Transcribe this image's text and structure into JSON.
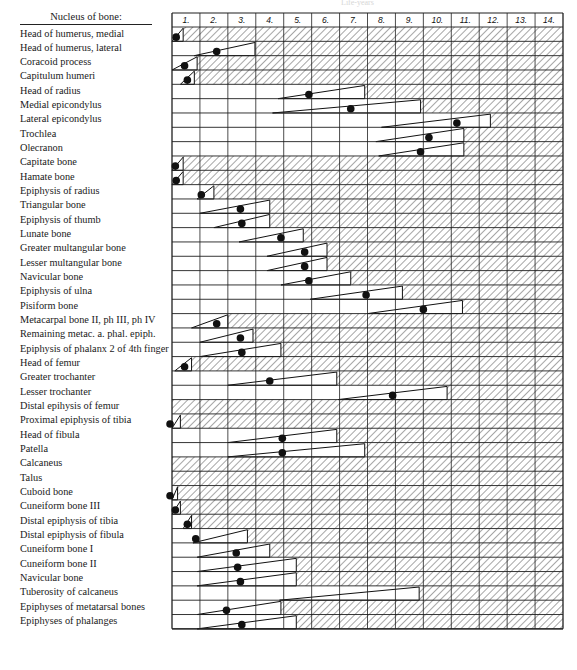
{
  "header": {
    "label_column_title": "Nucleus of bone:",
    "faint_top_text": "Life-years"
  },
  "grid": {
    "x0": 172,
    "x1": 563,
    "header_top": 13,
    "header_bottom": 27,
    "row_top": 27,
    "row_height": 14.33,
    "line_color": "#1f1f1f",
    "hatch_color": "#333333",
    "dot_color": "#111111"
  },
  "chart_data": {
    "type": "table",
    "xlabel": "Age (years)",
    "columns": [
      "1.",
      "2.",
      "3.",
      "4.",
      "5.",
      "6.",
      "7.",
      "8.",
      "9.",
      "10.",
      "11.",
      "12.",
      "13.",
      "14."
    ],
    "legend": {
      "wedge": "range of appearance (open triangle)",
      "dot": "typical/mean age of appearance",
      "hatch": "nucleus present"
    },
    "rows": [
      {
        "name": "Head of humerus, medial",
        "start": 0.0,
        "end": 0.4,
        "dot": 0.15
      },
      {
        "name": "Head of humerus, lateral",
        "start": 0.8,
        "end": 2.97,
        "dot": 1.6
      },
      {
        "name": "Coracoid process",
        "start": 0.0,
        "end": 0.9,
        "dot": 0.45
      },
      {
        "name": "Capitulum humeri",
        "start": 0.3,
        "end": 0.8,
        "dot": 0.55
      },
      {
        "name": "Head of radius",
        "start": 3.8,
        "end": 6.9,
        "dot": 4.9
      },
      {
        "name": "Medial epicondylus",
        "start": 3.6,
        "end": 8.9,
        "dot": 6.4
      },
      {
        "name": "Lateral epicondylus",
        "start": 7.5,
        "end": 11.4,
        "dot": 10.2
      },
      {
        "name": "Trochlea",
        "start": 7.3,
        "end": 10.45,
        "dot": 9.2
      },
      {
        "name": "Olecranon",
        "start": 7.4,
        "end": 10.45,
        "dot": 8.9
      },
      {
        "name": "Capitate bone",
        "start": 0.0,
        "end": 0.4,
        "dot": 0.12
      },
      {
        "name": "Hamate bone",
        "start": 0.0,
        "end": 0.4,
        "dot": 0.15
      },
      {
        "name": "Epiphysis of radius",
        "start": 0.9,
        "end": 1.5,
        "dot": 1.05
      },
      {
        "name": "Triangular bone",
        "start": 1.0,
        "end": 3.5,
        "dot": 2.45
      },
      {
        "name": "Epiphysis of thumb",
        "start": 1.5,
        "end": 3.5,
        "dot": 2.5
      },
      {
        "name": "Lunate bone",
        "start": 2.4,
        "end": 4.7,
        "dot": 3.9
      },
      {
        "name": "Greater multangular bone",
        "start": 3.4,
        "end": 5.55,
        "dot": 4.75
      },
      {
        "name": "Lesser multangular bone",
        "start": 3.4,
        "end": 5.55,
        "dot": 4.75
      },
      {
        "name": "Navicular bone",
        "start": 3.9,
        "end": 6.4,
        "dot": 4.9
      },
      {
        "name": "Epiphysis of ulna",
        "start": 4.95,
        "end": 8.25,
        "dot": 6.95
      },
      {
        "name": "Pisiform bone",
        "start": 7.0,
        "end": 10.4,
        "dot": 9.0
      },
      {
        "name": "Metacarpal bone II, ph III, ph IV",
        "start": 0.7,
        "end": 2.0,
        "dot": 1.6
      },
      {
        "name": "Remaining metac. a. phal. epiph.",
        "start": 1.0,
        "end": 2.9,
        "dot": 2.45
      },
      {
        "name": "Epiphysis of phalanx 2 of 4th finger",
        "start": 1.0,
        "end": 3.9,
        "dot": 2.5
      },
      {
        "name": "Head of femur",
        "start": 0.1,
        "end": 0.7,
        "dot": 0.45
      },
      {
        "name": "Greater trochanter",
        "start": 2.0,
        "end": 5.9,
        "dot": 3.5
      },
      {
        "name": "Lesser trochanter",
        "start": 5.95,
        "end": 9.85,
        "dot": 7.9
      },
      {
        "name": "Distal epihysis of femur",
        "start": 0.0,
        "end": 0.0,
        "dot": null
      },
      {
        "name": "Proximal epiphysis of tibia",
        "start": 0.0,
        "end": 0.3,
        "dot": -0.07
      },
      {
        "name": "Head of fibula",
        "start": 2.0,
        "end": 5.9,
        "dot": 3.95
      },
      {
        "name": "Patella",
        "start": 2.0,
        "end": 6.9,
        "dot": 3.95
      },
      {
        "name": "Calcaneus",
        "start": 0.0,
        "end": 0.0,
        "dot": null
      },
      {
        "name": "Talus",
        "start": 0.0,
        "end": 0.0,
        "dot": null
      },
      {
        "name": "Cuboid bone",
        "start": 0.0,
        "end": 0.2,
        "dot": -0.07
      },
      {
        "name": "Cuneiform bone III",
        "start": 0.0,
        "end": 0.3,
        "dot": 0.12
      },
      {
        "name": "Distal epiphysis of tibia",
        "start": 0.4,
        "end": 0.7,
        "dot": 0.55
      },
      {
        "name": "Distal epiphysis of fibula",
        "start": 0.75,
        "end": 2.7,
        "dot": 0.85
      },
      {
        "name": "Cuneiform bone I",
        "start": 0.9,
        "end": 3.5,
        "dot": 2.3
      },
      {
        "name": "Cuneiform bone II",
        "start": 0.9,
        "end": 4.45,
        "dot": 2.35
      },
      {
        "name": "Navicular bone",
        "start": 0.9,
        "end": 4.45,
        "dot": 2.45
      },
      {
        "name": "Tuberosity of calcaneus",
        "start": 3.85,
        "end": 8.85,
        "dot": null
      },
      {
        "name": "Epiphyses of metatarsal bones",
        "start": 0.9,
        "end": 3.9,
        "dot": 1.95
      },
      {
        "name": "Epiphyses of phalanges",
        "start": 0.9,
        "end": 4.45,
        "dot": 2.5
      }
    ]
  }
}
